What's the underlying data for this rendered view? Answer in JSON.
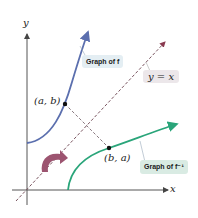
{
  "diagram": {
    "axes": {
      "x_label": "x",
      "y_label": "y"
    },
    "labels": {
      "graph_f": "Graph of f",
      "graph_f_inv": "Graph of f⁻¹",
      "identity_line": "y = x",
      "point_ab": "(a, b)",
      "point_ba": "(b, a)"
    },
    "colors": {
      "f_curve": "#5b6fae",
      "f_inv_curve": "#2aa57a",
      "identity_line": "#7a5560",
      "reflection_arrow": "#9c5470",
      "label_box_f": "#e4eef3",
      "label_box_f_inv": "#d9ebe3",
      "label_box_identity": "#ece7ea"
    }
  }
}
